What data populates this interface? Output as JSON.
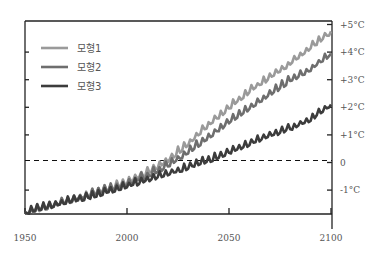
{
  "chart_data": {
    "type": "line",
    "title": "",
    "xlabel": "",
    "ylabel": "",
    "x_ticks": [
      "1950",
      "2000",
      "2050",
      "2100"
    ],
    "y_ticks": [
      "+5°C",
      "+4°C",
      "+3°C",
      "+2°C",
      "+1°C",
      "0",
      "-1°C"
    ],
    "xlim": [
      1950,
      2100
    ],
    "ylim": [
      -1.85,
      5.1
    ],
    "y_axis_position": "right",
    "grid": false,
    "reference_line": {
      "y": 0,
      "style": "dashed",
      "color": "#111111"
    },
    "legend_position": "upper left",
    "x": [
      1950,
      1960,
      1970,
      1980,
      1990,
      2000,
      2010,
      2020,
      2030,
      2040,
      2050,
      2060,
      2070,
      2080,
      2090,
      2100
    ],
    "series": [
      {
        "name": "모형1",
        "color": "#9a9a9a",
        "values": [
          -1.8,
          -1.6,
          -1.4,
          -1.2,
          -0.95,
          -0.7,
          -0.35,
          0.1,
          0.7,
          1.4,
          2.0,
          2.6,
          3.1,
          3.6,
          4.2,
          4.75
        ]
      },
      {
        "name": "모형2",
        "color": "#6e6e6e",
        "values": [
          -1.8,
          -1.6,
          -1.4,
          -1.2,
          -0.95,
          -0.75,
          -0.45,
          -0.1,
          0.4,
          0.95,
          1.5,
          2.0,
          2.5,
          3.0,
          3.4,
          3.95
        ]
      },
      {
        "name": "모형3",
        "color": "#3c3c3c",
        "values": [
          -1.8,
          -1.6,
          -1.4,
          -1.25,
          -1.05,
          -0.85,
          -0.6,
          -0.4,
          -0.15,
          0.1,
          0.4,
          0.7,
          1.0,
          1.25,
          1.6,
          2.1
        ]
      }
    ]
  },
  "legend": {
    "items": [
      {
        "label": "모형1",
        "color": "#9a9a9a"
      },
      {
        "label": "모형2",
        "color": "#6e6e6e"
      },
      {
        "label": "모형3",
        "color": "#3c3c3c"
      }
    ]
  },
  "axes": {
    "x_labels": [
      "1950",
      "2000",
      "2050",
      "2100"
    ],
    "y_labels": [
      "+5°C",
      "+4°C",
      "+3°C",
      "+2°C",
      "+1°C",
      "0",
      "-1°C"
    ]
  }
}
